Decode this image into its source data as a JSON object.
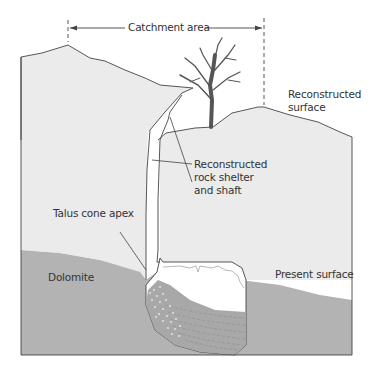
{
  "labels": {
    "catchment": "Catchment area",
    "reconstructed_surface_1": "Reconstructed",
    "reconstructed_surface_2": "surface",
    "rock_shelter_1": "Reconstructed",
    "rock_shelter_2": "rock shelter",
    "rock_shelter_3": "and shaft",
    "talus": "Talus cone apex",
    "dolomite": "Dolomite",
    "present_surface": "Present surface"
  },
  "colors": {
    "reconstructed_rock": "#ebebeb",
    "dolomite": "#b3b3b3",
    "sediment": "#a8a8a8",
    "outline": "#444444",
    "tree": "#555555"
  }
}
